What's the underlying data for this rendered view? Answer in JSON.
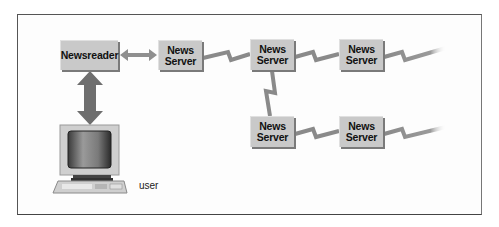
{
  "diagram": {
    "title": "",
    "nodes": [
      {
        "id": "newsreader",
        "label": "Newsreader"
      },
      {
        "id": "ns1",
        "line1": "News",
        "line2": "Server"
      },
      {
        "id": "ns2",
        "line1": "News",
        "line2": "Server"
      },
      {
        "id": "ns3",
        "line1": "News",
        "line2": "Server"
      },
      {
        "id": "ns4",
        "line1": "News",
        "line2": "Server"
      },
      {
        "id": "ns5",
        "line1": "News",
        "line2": "Server"
      }
    ],
    "user_label": "user",
    "edges": [
      {
        "from": "user-computer",
        "to": "newsreader",
        "type": "double-arrow"
      },
      {
        "from": "newsreader",
        "to": "ns1",
        "type": "double-arrow"
      },
      {
        "from": "ns1",
        "to": "ns2",
        "type": "lightning-link"
      },
      {
        "from": "ns2",
        "to": "ns3",
        "type": "lightning-link"
      },
      {
        "from": "ns3",
        "to": "offscreen-right",
        "type": "lightning-link-fade"
      },
      {
        "from": "ns2",
        "to": "ns4",
        "type": "lightning-link"
      },
      {
        "from": "ns4",
        "to": "ns5",
        "type": "lightning-link"
      },
      {
        "from": "ns5",
        "to": "offscreen-right",
        "type": "lightning-link-fade"
      }
    ],
    "colors": {
      "box_fill": "#c9c9c9",
      "box_shadow": "#7a7a7a",
      "link": "#8a8a8a",
      "arrow_dark": "#6e6e6e",
      "frame": "#555555"
    }
  }
}
